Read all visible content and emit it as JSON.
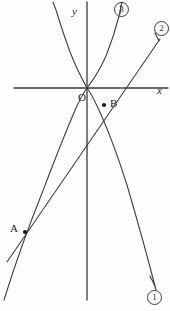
{
  "figure": {
    "kind": "coordinate-geometry-diagram",
    "background": "#fefefe",
    "stroke_color": "#3a3a3a",
    "axis_color": "#3a3a3a",
    "width": 170,
    "height": 311
  },
  "axes": {
    "origin_label": "O",
    "x_label": "x",
    "y_label": "y",
    "origin_px": {
      "x": 87,
      "y": 88
    },
    "x_axis": {
      "x1": 14,
      "y1": 88,
      "x2": 168,
      "y2": 88
    },
    "y_axis": {
      "x1": 87,
      "y1": 2,
      "x2": 87,
      "y2": 300
    }
  },
  "points": [
    {
      "name": "A",
      "label": "A",
      "px": {
        "x": 25,
        "y": 232
      },
      "label_px": {
        "x": 10,
        "y": 223
      }
    },
    {
      "name": "B",
      "label": "B",
      "px": {
        "x": 104,
        "y": 105
      },
      "label_px": {
        "x": 110,
        "y": 98
      }
    }
  ],
  "curves": [
    {
      "id": "curve-1",
      "label": "1",
      "marker": "①",
      "type": "parabola-down",
      "description": "downward opening parabola with vertex at origin passing through A and B",
      "label_px": {
        "x": 147,
        "y": 290
      },
      "path": "M 4 300 Q 20 248 44 188 Q 63 138 76 108 Q 83 93 87 88 Q 91 93 98 108 Q 112 138 127 185 Q 144 243 156 290"
    },
    {
      "id": "curve-2",
      "label": "2",
      "marker": "②",
      "type": "line",
      "description": "straight line through A and B rising to the upper right",
      "label_px": {
        "x": 154,
        "y": 21
      },
      "path": "M 7 262 L 160 39"
    },
    {
      "id": "curve-3",
      "label": "3",
      "marker": "③",
      "type": "parabola-up-steep",
      "description": "steep upward opening parabola branch from origin to upper right",
      "label_px": {
        "x": 114,
        "y": 2
      },
      "path": "M 87 88 Q 98 74 106 56 Q 114 36 119 16 L 122 2"
    },
    {
      "id": "curve-4",
      "label": "",
      "marker": "",
      "type": "parabola-up-wide",
      "description": "wide upward opening parabola with vertex at origin, unlabeled left branch",
      "label_px": null,
      "path": "M 87 88 Q 78 72 70 52 Q 62 30 56 10 L 53 2"
    }
  ],
  "connector_lines": [
    {
      "id": "leader-1",
      "from": "curve-1",
      "path": "M 155 286 L 150 276"
    },
    {
      "id": "leader-2",
      "from": "curve-2",
      "path": "M 159 41 L 155 33"
    },
    {
      "id": "leader-3",
      "from": "curve-3",
      "path": "M 121 5 L 120 14"
    }
  ]
}
